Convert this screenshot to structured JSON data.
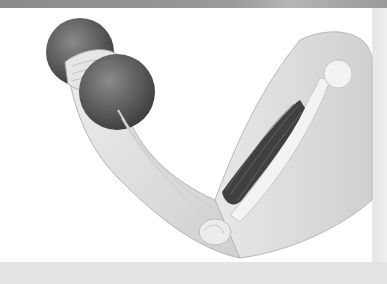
{
  "image": {
    "subject": "anatomical illustration of arm curling dumbbell",
    "elements": [
      "dumbbell",
      "hand",
      "forearm",
      "biceps-muscle",
      "humerus-bone",
      "elbow-joint",
      "shoulder"
    ],
    "palette": {
      "frame": "#9a9a9a",
      "background": "#ffffff",
      "skin": "#e2e2e2",
      "dumbbell": "#5e5e5e",
      "muscle": "#3f3f3f",
      "bone": "#f2f2f2"
    }
  }
}
